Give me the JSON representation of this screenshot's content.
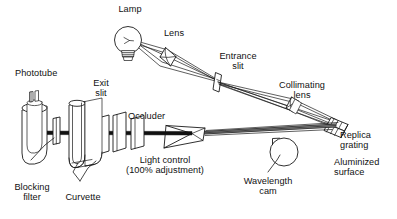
{
  "figure": {
    "type": "optical-schematic",
    "background_color": "#ffffff",
    "line_color": "#1a1a1a",
    "beam_color": "#111111",
    "beam_highlight_color": "#9a9a9a",
    "width": 397,
    "height": 219
  },
  "labels": {
    "lamp": "Lamp",
    "lens": "Lens",
    "entrance_slit": "Entrance\nslit",
    "collimating_lens": "Collimating\nlens",
    "replica_grating": "Replica\ngrating",
    "aluminized_surface": "Aluminized\nsurface",
    "wavelength_cam": "Wavelength\ncam",
    "occluder": "Occluder",
    "light_control": "Light control\n(100% adjustment)",
    "exit_slit": "Exit\nslit",
    "phototube": "Phototube",
    "blocking_filter": "Blocking\nfilter",
    "curvette": "Curvette"
  },
  "components": [
    {
      "id": "lamp",
      "name": "Lamp",
      "kind": "light-source"
    },
    {
      "id": "lens",
      "name": "Lens",
      "kind": "optic"
    },
    {
      "id": "entrance-slit",
      "name": "Entrance slit",
      "kind": "aperture"
    },
    {
      "id": "collimating-lens",
      "name": "Collimating lens",
      "kind": "optic"
    },
    {
      "id": "replica-grating",
      "name": "Replica grating",
      "kind": "dispersive-element"
    },
    {
      "id": "aluminized-surface",
      "name": "Aluminized surface",
      "kind": "surface"
    },
    {
      "id": "wavelength-cam",
      "name": "Wavelength cam",
      "kind": "mechanism"
    },
    {
      "id": "occluder",
      "name": "Occluder",
      "kind": "shutter"
    },
    {
      "id": "light-control",
      "name": "Light control (100% adjustment)",
      "kind": "control"
    },
    {
      "id": "exit-slit",
      "name": "Exit slit",
      "kind": "aperture"
    },
    {
      "id": "curvette",
      "name": "Curvette",
      "kind": "sample-holder"
    },
    {
      "id": "blocking-filter",
      "name": "Blocking filter",
      "kind": "filter"
    },
    {
      "id": "phototube",
      "name": "Phototube",
      "kind": "detector"
    }
  ]
}
